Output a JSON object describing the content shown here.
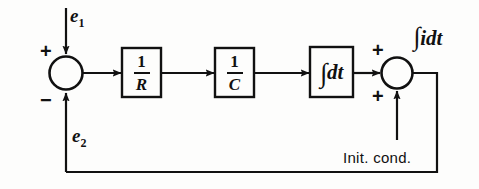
{
  "diagram": {
    "type": "control-system-block-diagram",
    "background_color": "#fdfdfc",
    "line_color": "#111111",
    "blocks": [
      {
        "id": "gain-r",
        "label": "1/R",
        "numerator": "1",
        "denominator": "R"
      },
      {
        "id": "gain-c",
        "label": "1/C",
        "numerator": "1",
        "denominator": "C"
      },
      {
        "id": "integrator",
        "label": "∫dt",
        "operator": "∫",
        "differential": "dt"
      }
    ],
    "summing_junctions": [
      {
        "id": "left-sum",
        "signs": [
          "+",
          "-"
        ],
        "top_sign": "+",
        "bottom_sign": "−"
      },
      {
        "id": "right-sum",
        "signs": [
          "+",
          "+"
        ],
        "top_sign": "+",
        "bottom_sign": "+"
      }
    ],
    "signals": {
      "input": "e",
      "input_sub": "1",
      "feedback": "e",
      "feedback_sub": "2",
      "output_operator": "∫",
      "output_expr": "idt",
      "initial_condition": "Init. cond."
    }
  }
}
